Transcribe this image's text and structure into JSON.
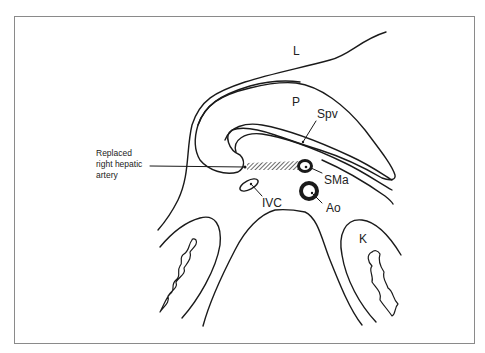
{
  "diagram": {
    "type": "anatomical cross-section line drawing",
    "labels": {
      "liver": "L",
      "pancreas": "P",
      "splenic_vein": "Spv",
      "superior_mesenteric_artery": "SMa",
      "inferior_vena_cava": "IVC",
      "aorta": "Ao",
      "kidney": "K",
      "replaced_artery_line1": "Replaced",
      "replaced_artery_line2": "right hepatic",
      "replaced_artery_line3": "artery"
    },
    "colors": {
      "stroke": "#1a1a1a",
      "frame": "#8a8a8a",
      "background": "#ffffff"
    }
  }
}
